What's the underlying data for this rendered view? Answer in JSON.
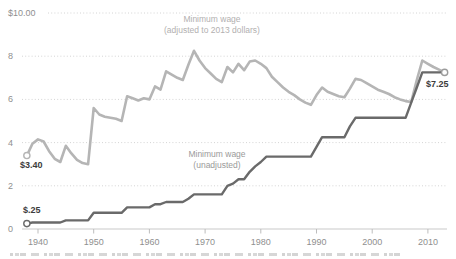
{
  "chart_data": {
    "type": "line",
    "title": "",
    "xlabel": "",
    "ylabel": "",
    "xlim": [
      1937,
      2014
    ],
    "ylim": [
      0,
      10
    ],
    "grid": {
      "style": "dotted-horizontal",
      "color": "#d4d4d4"
    },
    "legend_position": "inline-labels",
    "x": [
      1938,
      1939,
      1940,
      1941,
      1942,
      1943,
      1944,
      1945,
      1946,
      1947,
      1948,
      1949,
      1950,
      1951,
      1952,
      1953,
      1954,
      1955,
      1956,
      1957,
      1958,
      1959,
      1960,
      1961,
      1962,
      1963,
      1964,
      1965,
      1966,
      1967,
      1968,
      1969,
      1970,
      1971,
      1972,
      1973,
      1974,
      1975,
      1976,
      1977,
      1978,
      1979,
      1980,
      1981,
      1982,
      1983,
      1984,
      1985,
      1986,
      1987,
      1988,
      1989,
      1990,
      1991,
      1992,
      1993,
      1994,
      1995,
      1996,
      1997,
      1998,
      1999,
      2000,
      2001,
      2002,
      2003,
      2004,
      2005,
      2006,
      2007,
      2008,
      2009,
      2010,
      2011,
      2012,
      2013
    ],
    "series": [
      {
        "name": "Minimum wage (adjusted to 2013 dollars)",
        "label_line1": "Minimum wage",
        "label_line2": "(adjusted to 2013 dollars)",
        "color": "#b5b5b5",
        "width": 2.6,
        "values": [
          3.4,
          3.95,
          4.15,
          4.05,
          3.6,
          3.25,
          3.1,
          3.85,
          3.5,
          3.2,
          3.05,
          3.0,
          5.6,
          5.3,
          5.2,
          5.15,
          5.1,
          5.0,
          6.15,
          6.05,
          5.95,
          6.05,
          6.0,
          6.6,
          6.45,
          7.3,
          7.15,
          7.0,
          6.9,
          7.6,
          8.25,
          7.8,
          7.45,
          7.2,
          6.95,
          6.8,
          7.5,
          7.25,
          7.65,
          7.35,
          7.75,
          7.8,
          7.65,
          7.45,
          7.05,
          6.8,
          6.55,
          6.35,
          6.2,
          6.0,
          5.85,
          5.75,
          6.2,
          6.55,
          6.35,
          6.25,
          6.15,
          6.1,
          6.5,
          6.95,
          6.9,
          6.75,
          6.6,
          6.45,
          6.35,
          6.25,
          6.1,
          6.0,
          5.92,
          5.88,
          6.9,
          7.8,
          7.65,
          7.5,
          7.38,
          7.25
        ]
      },
      {
        "name": "Minimum wage (unadjusted)",
        "label_line1": "Minimum wage",
        "label_line2": "(unadjusted)",
        "color": "#6a6a6a",
        "width": 2.4,
        "values": [
          0.25,
          0.3,
          0.3,
          0.3,
          0.3,
          0.3,
          0.3,
          0.4,
          0.4,
          0.4,
          0.4,
          0.4,
          0.75,
          0.75,
          0.75,
          0.75,
          0.75,
          0.75,
          1.0,
          1.0,
          1.0,
          1.0,
          1.0,
          1.15,
          1.15,
          1.25,
          1.25,
          1.25,
          1.25,
          1.4,
          1.6,
          1.6,
          1.6,
          1.6,
          1.6,
          1.6,
          2.0,
          2.1,
          2.3,
          2.3,
          2.65,
          2.9,
          3.1,
          3.35,
          3.35,
          3.35,
          3.35,
          3.35,
          3.35,
          3.35,
          3.35,
          3.35,
          3.8,
          4.25,
          4.25,
          4.25,
          4.25,
          4.25,
          4.75,
          5.15,
          5.15,
          5.15,
          5.15,
          5.15,
          5.15,
          5.15,
          5.15,
          5.15,
          5.15,
          5.85,
          6.55,
          7.25,
          7.25,
          7.25,
          7.25,
          7.25
        ]
      }
    ],
    "yticks": [
      {
        "value": 10,
        "label": "$10.00"
      },
      {
        "value": 8,
        "label": "8"
      },
      {
        "value": 6,
        "label": "6"
      },
      {
        "value": 4,
        "label": "4"
      },
      {
        "value": 2,
        "label": "2"
      },
      {
        "value": 0,
        "label": "0"
      }
    ],
    "xticks": [
      {
        "value": 1940,
        "label": "1940"
      },
      {
        "value": 1950,
        "label": "1950"
      },
      {
        "value": 1960,
        "label": "1960"
      },
      {
        "value": 1970,
        "label": "1970"
      },
      {
        "value": 1980,
        "label": "1980"
      },
      {
        "value": 1990,
        "label": "1990"
      },
      {
        "value": 2000,
        "label": "2000"
      },
      {
        "value": 2010,
        "label": "2010"
      }
    ],
    "annotations": [
      {
        "text": "$3.40",
        "series": "adjusted",
        "year": 1938
      },
      {
        "text": "$.25",
        "series": "unadjusted",
        "year": 1938
      },
      {
        "text": "$7.25",
        "series": "both",
        "year": 2013
      }
    ],
    "markers": [
      {
        "year": 1938,
        "value": 3.4,
        "ring": "#b5b5b5"
      },
      {
        "year": 1938,
        "value": 0.25,
        "ring": "#6a6a6a"
      },
      {
        "year": 2013,
        "value": 7.25,
        "ring": "#9c9c9c"
      }
    ]
  },
  "colors": {
    "background": "#ffffff",
    "axis_text": "#8f8f8f",
    "annotation_text": "#3c3c3c",
    "baseline": "#c9c9c9",
    "gridline": "#d4d4d4"
  }
}
